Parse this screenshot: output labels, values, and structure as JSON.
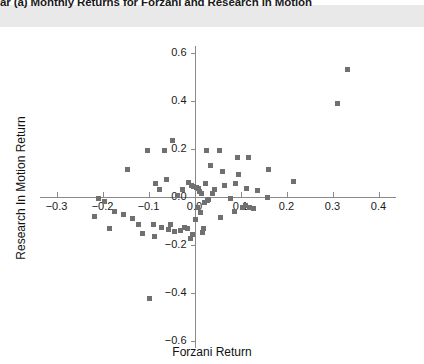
{
  "figure": {
    "title": "ar (a) Monthly Returns for Forzani and Research in Motion",
    "background_color": "#ffffff",
    "header_band_color": "#e9e9e9",
    "marker_color": "#707070",
    "axis_color": "#8a8a8a"
  },
  "chart_data": {
    "type": "scatter",
    "title": "ar (a) Monthly Returns for Forzani and Research in Motion",
    "xlabel": "Forzani Return",
    "ylabel": "Research In Motion Return",
    "xlim": [
      -0.33,
      0.44
    ],
    "ylim": [
      -0.62,
      0.62
    ],
    "xticks": [
      -0.3,
      -0.2,
      -0.1,
      0.0,
      0.1,
      0.2,
      0.3,
      0.4
    ],
    "xtick_labels": [
      "−0.3",
      "−0.2",
      "−0.1",
      "0.0",
      "0.1",
      "0.2",
      "0.3",
      "0.4"
    ],
    "yticks": [
      -0.6,
      -0.4,
      -0.2,
      0.0,
      0.2,
      0.4,
      0.6
    ],
    "ytick_labels": [
      "−0.6",
      "−0.4",
      "−0.2",
      "0.0",
      "0.2",
      "0.4",
      "0.6"
    ],
    "grid": false,
    "legend": null,
    "marker": "square",
    "points": [
      {
        "x": 0.333,
        "y": 0.529
      },
      {
        "x": 0.311,
        "y": 0.387
      },
      {
        "x": 0.215,
        "y": 0.063
      },
      {
        "x": 0.161,
        "y": 0.113
      },
      {
        "x": 0.159,
        "y": -0.004
      },
      {
        "x": 0.137,
        "y": 0.025
      },
      {
        "x": 0.128,
        "y": -0.05
      },
      {
        "x": 0.119,
        "y": -0.046
      },
      {
        "x": 0.117,
        "y": 0.163
      },
      {
        "x": 0.113,
        "y": 0.033
      },
      {
        "x": 0.111,
        "y": -0.038
      },
      {
        "x": 0.104,
        "y": -0.046
      },
      {
        "x": 0.096,
        "y": 0.092
      },
      {
        "x": 0.093,
        "y": 0.163
      },
      {
        "x": 0.089,
        "y": 0.054
      },
      {
        "x": 0.087,
        "y": -0.062
      },
      {
        "x": 0.078,
        "y": -0.008
      },
      {
        "x": 0.065,
        "y": 0.046
      },
      {
        "x": 0.061,
        "y": 0.104
      },
      {
        "x": 0.057,
        "y": -0.087
      },
      {
        "x": 0.054,
        "y": 0.192
      },
      {
        "x": 0.043,
        "y": 0.029
      },
      {
        "x": 0.039,
        "y": 0.013
      },
      {
        "x": 0.035,
        "y": 0.129
      },
      {
        "x": 0.03,
        "y": -0.012
      },
      {
        "x": 0.028,
        "y": -0.017
      },
      {
        "x": 0.026,
        "y": 0.192
      },
      {
        "x": 0.024,
        "y": 0.054
      },
      {
        "x": 0.022,
        "y": -0.025
      },
      {
        "x": 0.02,
        "y": -0.133
      },
      {
        "x": 0.017,
        "y": -0.15
      },
      {
        "x": 0.015,
        "y": 0.013
      },
      {
        "x": 0.013,
        "y": -0.067
      },
      {
        "x": 0.011,
        "y": 0.021
      },
      {
        "x": 0.009,
        "y": 0.033
      },
      {
        "x": 0.007,
        "y": -0.046
      },
      {
        "x": 0.004,
        "y": 0.038
      },
      {
        "x": 0.002,
        "y": -0.096
      },
      {
        "x": -0.002,
        "y": 0.042
      },
      {
        "x": -0.004,
        "y": -0.158
      },
      {
        "x": -0.007,
        "y": 0.046
      },
      {
        "x": -0.009,
        "y": -0.175
      },
      {
        "x": -0.013,
        "y": 0.058
      },
      {
        "x": -0.015,
        "y": -0.133
      },
      {
        "x": -0.022,
        "y": -0.129
      },
      {
        "x": -0.026,
        "y": 0.029
      },
      {
        "x": -0.03,
        "y": -0.142
      },
      {
        "x": -0.037,
        "y": 0.004
      },
      {
        "x": -0.043,
        "y": -0.146
      },
      {
        "x": -0.048,
        "y": 0.233
      },
      {
        "x": -0.052,
        "y": -0.117
      },
      {
        "x": -0.057,
        "y": -0.138
      },
      {
        "x": -0.061,
        "y": 0.071
      },
      {
        "x": -0.065,
        "y": 0.192
      },
      {
        "x": -0.072,
        "y": -0.129
      },
      {
        "x": -0.076,
        "y": 0.029
      },
      {
        "x": -0.085,
        "y": 0.054
      },
      {
        "x": -0.087,
        "y": -0.167
      },
      {
        "x": -0.089,
        "y": -0.117
      },
      {
        "x": -0.098,
        "y": -0.425
      },
      {
        "x": -0.102,
        "y": 0.192
      },
      {
        "x": -0.113,
        "y": -0.154
      },
      {
        "x": -0.122,
        "y": -0.117
      },
      {
        "x": -0.135,
        "y": -0.092
      },
      {
        "x": -0.146,
        "y": 0.113
      },
      {
        "x": -0.154,
        "y": -0.075
      },
      {
        "x": -0.174,
        "y": -0.062
      },
      {
        "x": -0.185,
        "y": -0.133
      },
      {
        "x": -0.196,
        "y": -0.021
      },
      {
        "x": -0.209,
        "y": -0.008
      },
      {
        "x": -0.217,
        "y": -0.083
      }
    ]
  },
  "axes": {
    "x_title": "Forzani Return",
    "y_title": "Research In Motion Return"
  }
}
